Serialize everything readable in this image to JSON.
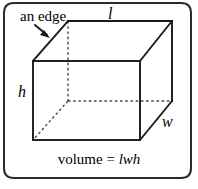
{
  "figure": {
    "kind": "rectangular-prism-volume-diagram",
    "caption": {
      "expression_text": "volume = lwh",
      "left_part": "volume = ",
      "variables": "lwh"
    },
    "annotations": {
      "edge_callout": "an edge",
      "length": "l",
      "width": "w",
      "height": "h"
    },
    "colors": {
      "stroke": "#1a1a1a",
      "hidden_stroke": "#4a4a4a",
      "background": "#ffffff",
      "border": "#2b2b2b"
    },
    "geometry": {
      "front_face": {
        "top_left": [
          33,
          61
        ],
        "top_right": [
          140,
          61
        ],
        "bottom_right": [
          140,
          140
        ],
        "bottom_left": [
          33,
          140
        ]
      },
      "back_face": {
        "top_left": [
          68,
          21
        ],
        "top_right": [
          172,
          21
        ],
        "bottom_right": [
          172,
          101
        ],
        "bottom_left": [
          68,
          101
        ]
      },
      "hidden_edges": [
        "back-top-left to back-bottom-left",
        "back-bottom-left to back-bottom-right",
        "back-bottom-left to front-bottom-left"
      ],
      "arrow": {
        "from": [
          35,
          25
        ],
        "to": [
          49,
          37
        ]
      }
    },
    "frame": {
      "left": 4,
      "top": 3,
      "right": 191,
      "bottom": 178,
      "corner_radius": 10
    }
  }
}
